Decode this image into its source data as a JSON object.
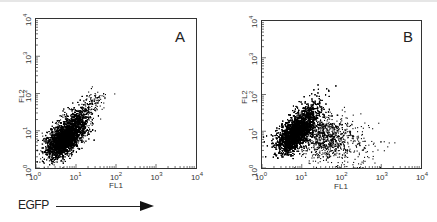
{
  "figure": {
    "annotation": {
      "label": "EGFP",
      "arrow": "right-arrow"
    }
  },
  "chart_data": [
    {
      "type": "scatter",
      "panel_label": "A",
      "title": "",
      "xlabel": "FL1",
      "ylabel": "FL2",
      "xscale": "log",
      "yscale": "log",
      "xlim": [
        1,
        10000
      ],
      "ylim": [
        1,
        10000
      ],
      "x_ticks": [
        "10^0",
        "10^1",
        "10^2",
        "10^3",
        "10^4"
      ],
      "y_ticks": [
        "10^0",
        "10^1",
        "10^2",
        "10^3",
        "10^4"
      ],
      "grid": false,
      "populations": [
        {
          "name": "main diagonal population",
          "center_x": 4,
          "center_y": 4,
          "spread_log": 0.35,
          "extends_to_x": 50,
          "extends_to_y": 100,
          "count": "dense"
        }
      ]
    },
    {
      "type": "scatter",
      "panel_label": "B",
      "title": "",
      "xlabel": "FL1",
      "ylabel": "FL2",
      "xscale": "log",
      "yscale": "log",
      "xlim": [
        1,
        10000
      ],
      "ylim": [
        1,
        10000
      ],
      "x_ticks": [
        "10^0",
        "10^1",
        "10^2",
        "10^3",
        "10^4"
      ],
      "y_ticks": [
        "10^0",
        "10^1",
        "10^2",
        "10^3",
        "10^4"
      ],
      "grid": false,
      "populations": [
        {
          "name": "main diagonal population",
          "center_x": 5,
          "center_y": 5,
          "spread_log": 0.35,
          "extends_to_x": 60,
          "extends_to_y": 150,
          "count": "dense"
        },
        {
          "name": "EGFP-positive population",
          "center_x": 50,
          "center_y": 6,
          "spread_log": 0.4,
          "extends_to_x": 2000,
          "count": "sparse"
        }
      ]
    }
  ],
  "panels": [
    {
      "letter": "A",
      "xlabel": "FL1",
      "ylabel": "FL2"
    },
    {
      "letter": "B",
      "xlabel": "FL1",
      "ylabel": "FL2"
    }
  ],
  "ticks": [
    "0",
    "1",
    "2",
    "3",
    "4"
  ],
  "tick_base": "10"
}
